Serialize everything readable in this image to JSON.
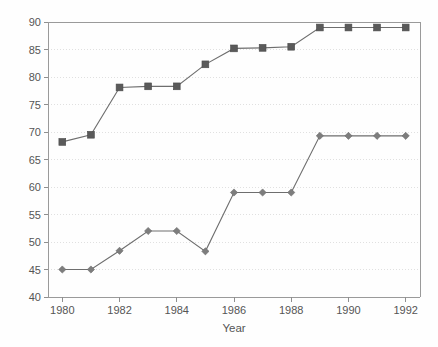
{
  "chart_data": {
    "type": "line",
    "title": "",
    "xlabel": "Year",
    "ylabel": "",
    "grid": true,
    "legend": "none",
    "xlim": [
      1979.5,
      1992.5
    ],
    "ylim": [
      40,
      90
    ],
    "y_ticks": [
      40,
      45,
      50,
      55,
      60,
      65,
      70,
      75,
      80,
      85,
      90
    ],
    "x_ticks": [
      1980,
      1982,
      1984,
      1986,
      1988,
      1990,
      1992
    ],
    "x_tick_labels": [
      "1980",
      "1982",
      "1984",
      "1986",
      "1988",
      "1990",
      "1992"
    ],
    "y_tick_labels": [
      "40",
      "45",
      "50",
      "55",
      "60",
      "65",
      "70",
      "75",
      "80",
      "85",
      "90"
    ],
    "x": [
      1980,
      1981,
      1982,
      1983,
      1984,
      1985,
      1986,
      1987,
      1988,
      1989,
      1990,
      1991,
      1992
    ],
    "series": [
      {
        "name": "upper-series",
        "marker": "square",
        "color": "#5a5a5a",
        "values": [
          68.2,
          69.5,
          78.1,
          78.3,
          78.3,
          82.3,
          85.2,
          85.3,
          85.5,
          89.0,
          89.0,
          89.0,
          89.0
        ]
      },
      {
        "name": "lower-series",
        "marker": "diamond",
        "color": "#7d7d7d",
        "values": [
          45.0,
          45.0,
          48.4,
          52.0,
          52.0,
          48.3,
          59.0,
          59.0,
          59.0,
          69.3,
          69.3,
          69.3,
          69.3
        ]
      }
    ]
  },
  "axes": {
    "x_axis_title": "Year"
  }
}
